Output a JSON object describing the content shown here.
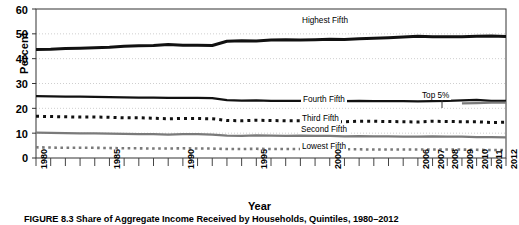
{
  "figure": {
    "caption": "FIGURE 8.3  Share of Aggregate Income Received by Households, Quintiles, 1980–2012",
    "xlabel": "Year",
    "ylabel": "Percent"
  },
  "series_labels": {
    "highest_fifth": "Highest Fifth",
    "fourth_fifth": "Fourth Fifth",
    "third_fifth": "Third Fifth",
    "second_fifth": "Second Fifth",
    "lowest_fifth": "Lowest Fifth",
    "top_5": "Top 5%"
  },
  "colors": {
    "black": "#111111",
    "gray": "#7a7a7a",
    "grid": "#cfcfcf",
    "axis": "#333333",
    "background": "#ffffff"
  },
  "chart_data": {
    "type": "line",
    "title": "",
    "xlabel": "Year",
    "ylabel": "Percent",
    "ylim": [
      0,
      60
    ],
    "yticks": [
      0,
      10,
      20,
      30,
      40,
      50,
      60
    ],
    "xlim": [
      1980,
      2012
    ],
    "xticks": [
      1980,
      1985,
      1990,
      1995,
      2000,
      2006,
      2007,
      2008,
      2009,
      2010,
      2011,
      2012
    ],
    "xtick_labels": [
      "1980",
      "1985",
      "1990",
      "1995",
      "2000",
      "2006",
      "2007",
      "2008",
      "2009",
      "2010",
      "2011",
      "2012"
    ],
    "grid": true,
    "legend": "inline-annotations",
    "x": [
      1980,
      1981,
      1982,
      1983,
      1984,
      1985,
      1986,
      1987,
      1988,
      1989,
      1990,
      1991,
      1992,
      1993,
      1994,
      1995,
      1996,
      1997,
      1998,
      1999,
      2000,
      2001,
      2002,
      2003,
      2004,
      2005,
      2006,
      2007,
      2008,
      2009,
      2010,
      2011,
      2012
    ],
    "series": [
      {
        "name": "Highest Fifth",
        "style": "solid",
        "color": "#111111",
        "width": 3,
        "values": [
          43.7,
          43.8,
          44.1,
          44.2,
          44.4,
          44.6,
          45.0,
          45.2,
          45.3,
          45.7,
          45.4,
          45.4,
          45.3,
          47.0,
          47.2,
          47.1,
          47.5,
          47.6,
          47.5,
          47.6,
          47.8,
          47.7,
          48.0,
          48.2,
          48.4,
          48.7,
          49.0,
          48.8,
          48.8,
          48.8,
          49.0,
          49.1,
          48.9
        ]
      },
      {
        "name": "Fourth Fifth",
        "style": "solid",
        "color": "#111111",
        "width": 2.4,
        "values": [
          24.9,
          24.8,
          24.7,
          24.7,
          24.6,
          24.5,
          24.4,
          24.3,
          24.3,
          24.2,
          24.2,
          24.2,
          24.1,
          23.3,
          23.1,
          23.2,
          23.0,
          23.0,
          23.0,
          23.0,
          22.9,
          22.9,
          23.0,
          22.9,
          22.9,
          22.9,
          22.8,
          22.9,
          23.0,
          23.2,
          23.4,
          23.0,
          23.0
        ]
      },
      {
        "name": "Top 5%",
        "style": "solid",
        "color": "#7a7a7a",
        "width": 2.4,
        "values": [
          null,
          null,
          null,
          null,
          null,
          null,
          null,
          null,
          null,
          null,
          null,
          null,
          null,
          null,
          null,
          null,
          null,
          null,
          null,
          null,
          null,
          null,
          null,
          null,
          null,
          null,
          null,
          null,
          null,
          22.0,
          22.1,
          22.3,
          22.3
        ]
      },
      {
        "name": "Third Fifth",
        "style": "dotted",
        "color": "#111111",
        "width": 3,
        "values": [
          16.8,
          16.7,
          16.6,
          16.5,
          16.5,
          16.4,
          16.2,
          16.2,
          16.0,
          15.8,
          15.9,
          15.9,
          15.8,
          15.1,
          15.0,
          15.2,
          15.1,
          15.0,
          15.0,
          14.9,
          14.8,
          14.6,
          14.8,
          14.8,
          14.7,
          14.6,
          14.5,
          14.8,
          14.7,
          14.6,
          14.6,
          14.3,
          14.4
        ]
      },
      {
        "name": "Second Fifth",
        "style": "solid",
        "color": "#7a7a7a",
        "width": 2.4,
        "values": [
          10.2,
          10.1,
          10.0,
          9.9,
          9.9,
          9.8,
          9.7,
          9.6,
          9.6,
          9.4,
          9.6,
          9.6,
          9.4,
          9.0,
          8.9,
          9.1,
          9.0,
          8.9,
          9.0,
          8.9,
          8.9,
          8.7,
          8.8,
          8.7,
          8.7,
          8.6,
          8.6,
          8.7,
          8.6,
          8.6,
          8.4,
          8.4,
          8.3
        ]
      },
      {
        "name": "Lowest Fifth",
        "style": "dotted",
        "color": "#7a7a7a",
        "width": 2.6,
        "values": [
          4.3,
          4.2,
          4.1,
          4.1,
          4.1,
          4.0,
          3.9,
          3.9,
          3.8,
          3.8,
          3.9,
          3.8,
          3.8,
          3.6,
          3.6,
          3.7,
          3.6,
          3.6,
          3.6,
          3.6,
          3.6,
          3.5,
          3.5,
          3.4,
          3.4,
          3.4,
          3.4,
          3.4,
          3.4,
          3.4,
          3.3,
          3.2,
          3.2
        ]
      }
    ]
  }
}
